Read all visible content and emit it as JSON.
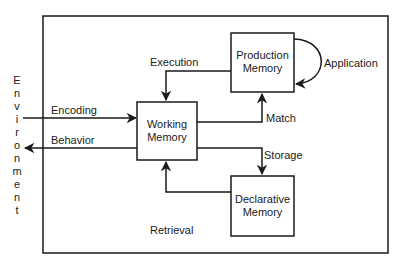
{
  "diagram": {
    "environment_label": [
      "E",
      "n",
      "v",
      "i",
      "r",
      "o",
      "n",
      "m",
      "e",
      "n",
      "t"
    ],
    "boxes": {
      "working_memory": [
        "Working",
        "Memory"
      ],
      "production_memory": [
        "Production",
        "Memory"
      ],
      "declarative_memory": [
        "Declarative",
        "Memory"
      ]
    },
    "edges": {
      "encoding": "Encoding",
      "behavior": "Behavior",
      "execution": "Execution",
      "match": "Match",
      "application": "Application",
      "storage": "Storage",
      "retrieval": "Retrieval"
    }
  }
}
